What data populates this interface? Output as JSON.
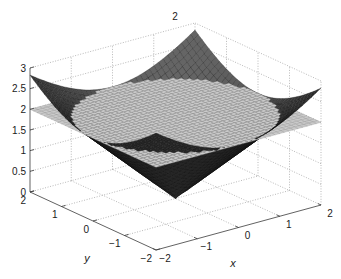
{
  "chart_data": {
    "type": "surface",
    "title": "2",
    "xlabel": "x",
    "ylabel": "y",
    "zlabel": "",
    "xlim": [
      -2,
      2
    ],
    "ylim": [
      -2,
      2
    ],
    "zlim": [
      0,
      3
    ],
    "x_ticks": [
      -2,
      -1,
      0,
      1,
      2
    ],
    "x_tick_labels": [
      "−2",
      "−1",
      "0",
      "1",
      "2"
    ],
    "y_ticks": [
      -2,
      -1,
      0,
      1,
      2
    ],
    "y_tick_labels": [
      "−2",
      "−1",
      "0",
      "1",
      "2"
    ],
    "z_ticks": [
      0,
      0.5,
      1,
      1.5,
      2,
      2.5,
      3
    ],
    "z_tick_labels": [
      "0",
      "0.5",
      "1",
      "1.5",
      "2",
      "2.5",
      "3"
    ],
    "grid": true,
    "legend": "none",
    "series": [
      {
        "name": "cone",
        "kind": "cone",
        "equation": "z = sqrt(x^2 + y^2)",
        "apex_z": 0,
        "slope": 1,
        "x_range": [
          -2,
          2
        ],
        "y_range": [
          -2,
          2
        ],
        "z_range": [
          0,
          2.83
        ],
        "color_dark": "#1c1c1c",
        "color_light": "#6a6a6a",
        "edge_color": "#101010"
      },
      {
        "name": "plane",
        "kind": "plane",
        "equation": "z = 2",
        "z": 2,
        "x_range": [
          -2,
          2
        ],
        "y_range": [
          -2,
          2
        ],
        "color": "#cacaca",
        "edge_color": "#8c8c8c"
      }
    ],
    "intersection": {
      "shape": "circle",
      "radius": 2,
      "z": 2
    }
  }
}
